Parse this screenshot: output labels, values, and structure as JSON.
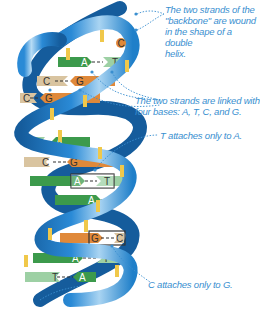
{
  "colors": {
    "backbone": "#1f7fc9",
    "backbone_dark": "#155c9c",
    "backbone_light": "#8fc3ea",
    "rung_marker": "#f0c84a",
    "base_A": "#3c9a4c",
    "base_T": "#9dd0a4",
    "base_G": "#e0893a",
    "base_C": "#d9c4a0",
    "label_text": "#3a8fd0"
  },
  "annotations": [
    {
      "id": "backbone",
      "text_lines": [
        "The two strands of the",
        "\"backbone\" are wound",
        "in the shape of a double",
        "helix."
      ]
    },
    {
      "id": "bases",
      "text_lines": [
        "The two strands are linked with",
        "four bases: A, T, C, and G."
      ]
    },
    {
      "id": "t-a",
      "text_lines": [
        "T attaches only to A."
      ]
    },
    {
      "id": "c-g",
      "text_lines": [
        "C attaches only to G."
      ]
    }
  ],
  "base_pairs": [
    {
      "left": "C",
      "right": "",
      "note": "single C at top"
    },
    {
      "left": "A",
      "right": "T"
    },
    {
      "left": "C",
      "right": "G"
    },
    {
      "left": "C",
      "right": "G"
    },
    {
      "left": "T",
      "right": "A"
    },
    {
      "left": "C",
      "right": "G"
    },
    {
      "left": "A",
      "right": "T",
      "highlighted": true
    },
    {
      "left": "A",
      "right": "T"
    },
    {
      "left": "G",
      "right": "C",
      "highlighted": true
    },
    {
      "left": "A",
      "right": "T"
    },
    {
      "left": "T",
      "right": "A"
    }
  ]
}
